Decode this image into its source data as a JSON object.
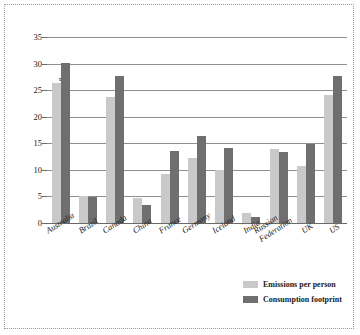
{
  "chart_data": {
    "type": "bar",
    "title": "",
    "xlabel": "",
    "ylabel": "tonnes CO2e",
    "ylabel_html": "tonnes CO<sub>2</sub>e",
    "ylim": [
      0,
      35
    ],
    "yticks": [
      0,
      5,
      10,
      15,
      20,
      25,
      30,
      35
    ],
    "grid": true,
    "legend_position": "bottom-right",
    "categories": [
      "Australia",
      "Brazil",
      "Canada",
      "China",
      "France",
      "Germany",
      "Iceland",
      "India",
      "Russian Federation",
      "UK",
      "US"
    ],
    "series": [
      {
        "name": "Emissions per person",
        "color": "#c9c9c9",
        "values": [
          26.3,
          5.0,
          23.8,
          4.8,
          9.2,
          12.3,
          9.9,
          1.8,
          13.9,
          10.8,
          24.1
        ]
      },
      {
        "name": "Consumption footprint",
        "color": "#6f6f6f",
        "values": [
          30.1,
          4.9,
          27.7,
          3.3,
          13.6,
          16.3,
          14.2,
          1.2,
          13.4,
          14.9,
          27.7
        ]
      }
    ]
  },
  "legend": {
    "items": [
      {
        "label": "Emissions per person",
        "color": "#c9c9c9"
      },
      {
        "label": "Consumption footprint",
        "color": "#6f6f6f"
      }
    ]
  }
}
